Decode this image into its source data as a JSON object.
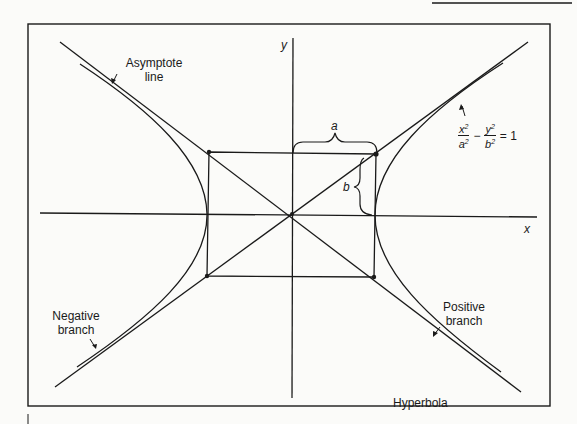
{
  "diagram": {
    "title": "Hyperbola",
    "axes": {
      "x_label": "x",
      "y_label": "y"
    },
    "dimensions": {
      "semi_major": "a",
      "semi_minor": "b"
    },
    "equation": {
      "term1_num": "x",
      "term1_den": "a",
      "term2_num": "y",
      "term2_den": "b",
      "exp": "2",
      "minus": "−",
      "rhs": "= 1",
      "text": "x²/a² − y²/b² = 1"
    },
    "annotations": {
      "asymptote_line1": "Asymptote",
      "asymptote_line2": "line",
      "negative_line1": "Negative",
      "negative_line2": "branch",
      "positive_line1": "Positive",
      "positive_line2": "branch"
    },
    "colors": {
      "ink": "#1a1a1a",
      "paper": "#fbfbf9"
    }
  }
}
